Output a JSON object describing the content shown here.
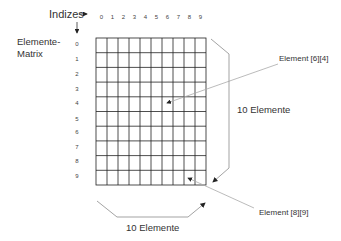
{
  "diagram": {
    "indices_label": "Indizes",
    "matrix_label_line1": "Elemente-",
    "matrix_label_line2": "Matrix",
    "column_indices": [
      "0",
      "1",
      "2",
      "3",
      "4",
      "5",
      "6",
      "7",
      "8",
      "9"
    ],
    "row_indices": [
      "0",
      "1",
      "2",
      "3",
      "4",
      "5",
      "6",
      "7",
      "8",
      "9"
    ],
    "rows": 10,
    "columns": 10,
    "callouts": [
      {
        "label": "Element [6][4]"
      },
      {
        "label": "Element [8][9]"
      }
    ],
    "vertical_size_label": "10 Elemente",
    "horizontal_size_label": "10 Elemente",
    "colors": {
      "grid": "#222222",
      "leader": "#aaaaaa",
      "bracket": "#999999"
    }
  }
}
